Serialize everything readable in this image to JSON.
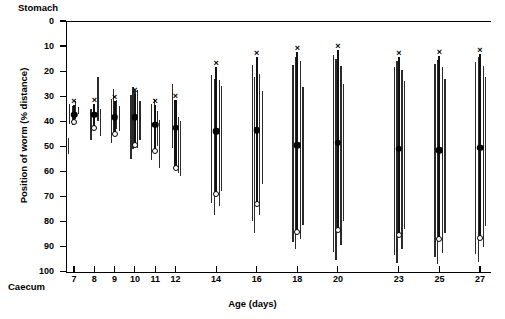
{
  "figure": {
    "stomach_label": "Stomach",
    "caecum_label": "Caecum",
    "x_axis_title": "Age (days)",
    "y_axis_title": "Position of worm (% distance)"
  },
  "chart_data": {
    "type": "scatter",
    "title": "",
    "xlabel": "Age (days)",
    "ylabel": "Position of worm (% distance)",
    "xlim": [
      6.2,
      28.4
    ],
    "ylim": [
      0,
      100
    ],
    "y_inverted": true,
    "grid": false,
    "legend": [],
    "y_ticks": [
      0,
      10,
      20,
      30,
      40,
      50,
      60,
      70,
      80,
      90,
      100
    ],
    "y_tick_labels": [
      "0",
      "10",
      "20",
      "30",
      "40",
      "50",
      "60",
      "70",
      "80",
      "90",
      "100"
    ],
    "x_ticks": [
      7,
      8,
      9,
      10,
      11,
      12,
      14,
      16,
      18,
      20,
      23,
      25,
      27
    ],
    "x_tick_labels": [
      "7",
      "8",
      "9",
      "10",
      "11",
      "12",
      "14",
      "16",
      "18",
      "20",
      "23",
      "25",
      "27"
    ],
    "axis_endpoint_annotations": {
      "top": "Stomach",
      "bottom": "Caecum"
    },
    "marker_meanings": {
      "cross": "upper extreme of worm distribution",
      "filled_circle": "mean position of worms",
      "open_circle": "lower extreme of worm distribution"
    },
    "series": [
      {
        "name": "Day 7",
        "x": 7,
        "summary": {
          "upper": 33.5,
          "mean": 37.5,
          "lower": 40.5
        },
        "ranges": [
          {
            "offset": -5,
            "top": 33.0,
            "bottom": 41.0
          },
          {
            "offset": -2,
            "top": 34.0,
            "bottom": 41.5
          },
          {
            "offset": 1,
            "top": 32.0,
            "bottom": 39.0
          },
          {
            "offset": 4,
            "top": 34.5,
            "bottom": 37.0
          },
          {
            "offset": -6,
            "top": 46.5,
            "bottom": 53.0
          }
        ]
      },
      {
        "name": "Day 8",
        "x": 8,
        "summary": {
          "upper": 33.0,
          "mean": 37.5,
          "lower": 42.5
        },
        "ranges": [
          {
            "offset": -4,
            "top": 35.0,
            "bottom": 47.5
          },
          {
            "offset": -1.5,
            "top": 33.5,
            "bottom": 44.0
          },
          {
            "offset": 3,
            "top": 22.5,
            "bottom": 40.0
          },
          {
            "offset": 5.5,
            "top": 35.0,
            "bottom": 46.0
          }
        ]
      },
      {
        "name": "Day 9",
        "x": 9,
        "summary": {
          "upper": 32.0,
          "mean": 38.5,
          "lower": 45.0
        },
        "ranges": [
          {
            "offset": -4,
            "top": 31.0,
            "bottom": 48.5
          },
          {
            "offset": -1.5,
            "top": 27.0,
            "bottom": 46.0
          },
          {
            "offset": 1.5,
            "top": 31.5,
            "bottom": 43.0
          },
          {
            "offset": 4,
            "top": 34.0,
            "bottom": 44.0
          }
        ]
      },
      {
        "name": "Day 10",
        "x": 10,
        "summary": {
          "upper": 29.0,
          "mean": 38.5,
          "lower": 49.5
        },
        "ranges": [
          {
            "offset": -4.5,
            "top": 29.5,
            "bottom": 55.0
          },
          {
            "offset": -2.5,
            "top": 26.5,
            "bottom": 51.0
          },
          {
            "offset": -0.5,
            "top": 28.0,
            "bottom": 49.0
          },
          {
            "offset": 2,
            "top": 27.5,
            "bottom": 50.5
          },
          {
            "offset": 4.5,
            "top": 32.0,
            "bottom": 47.5
          }
        ]
      },
      {
        "name": "Day 11",
        "x": 11,
        "summary": {
          "upper": 33.5,
          "mean": 41.5,
          "lower": 52.0
        },
        "ranges": [
          {
            "offset": -4,
            "top": 33.0,
            "bottom": 55.5
          },
          {
            "offset": -1.5,
            "top": 31.0,
            "bottom": 52.5
          },
          {
            "offset": 1.5,
            "top": 36.0,
            "bottom": 50.0
          },
          {
            "offset": 4,
            "top": 39.5,
            "bottom": 58.5
          }
        ]
      },
      {
        "name": "Day 12",
        "x": 12,
        "summary": {
          "upper": 31.5,
          "mean": 42.5,
          "lower": 58.5
        },
        "ranges": [
          {
            "offset": -4,
            "top": 25.0,
            "bottom": 50.5
          },
          {
            "offset": -1.5,
            "top": 34.0,
            "bottom": 56.0
          },
          {
            "offset": 2,
            "top": 38.5,
            "bottom": 60.5
          },
          {
            "offset": 4.5,
            "top": 40.0,
            "bottom": 62.0
          }
        ]
      },
      {
        "name": "Day 14",
        "x": 14,
        "summary": {
          "upper": 18.5,
          "mean": 44.0,
          "lower": 69.0
        },
        "ranges": [
          {
            "offset": -5,
            "top": 21.5,
            "bottom": 72.5
          },
          {
            "offset": -2.5,
            "top": 23.0,
            "bottom": 77.5
          },
          {
            "offset": 2.5,
            "top": 23.5,
            "bottom": 74.0
          },
          {
            "offset": 5,
            "top": 26.0,
            "bottom": 68.0
          }
        ]
      },
      {
        "name": "Day 16",
        "x": 16,
        "summary": {
          "upper": 14.5,
          "mean": 43.5,
          "lower": 73.0
        },
        "ranges": [
          {
            "offset": -5,
            "top": 17.5,
            "bottom": 80.0
          },
          {
            "offset": -2.5,
            "top": 22.5,
            "bottom": 84.5
          },
          {
            "offset": 2.5,
            "top": 21.0,
            "bottom": 77.5
          },
          {
            "offset": 5,
            "top": 28.0,
            "bottom": 65.0
          }
        ]
      },
      {
        "name": "Day 18",
        "x": 18,
        "summary": {
          "upper": 12.5,
          "mean": 49.5,
          "lower": 84.0
        },
        "ranges": [
          {
            "offset": -5,
            "top": 17.5,
            "bottom": 88.0
          },
          {
            "offset": -2.5,
            "top": 14.5,
            "bottom": 91.0
          },
          {
            "offset": 2.5,
            "top": 16.0,
            "bottom": 87.0
          },
          {
            "offset": 5,
            "top": 26.5,
            "bottom": 81.5
          }
        ]
      },
      {
        "name": "Day 20",
        "x": 20,
        "summary": {
          "upper": 11.5,
          "mean": 48.5,
          "lower": 83.5
        },
        "ranges": [
          {
            "offset": -5,
            "top": 13.5,
            "bottom": 92.0
          },
          {
            "offset": -2.5,
            "top": 15.0,
            "bottom": 95.5
          },
          {
            "offset": 2.5,
            "top": 18.0,
            "bottom": 89.5
          },
          {
            "offset": 5,
            "top": 25.0,
            "bottom": 80.0
          }
        ]
      },
      {
        "name": "Day 23",
        "x": 23,
        "summary": {
          "upper": 14.5,
          "mean": 51.0,
          "lower": 85.5
        },
        "ranges": [
          {
            "offset": -5,
            "top": 18.5,
            "bottom": 93.5
          },
          {
            "offset": -2.5,
            "top": 16.0,
            "bottom": 96.5
          },
          {
            "offset": 2.5,
            "top": 19.5,
            "bottom": 91.0
          },
          {
            "offset": 5,
            "top": 24.0,
            "bottom": 83.0
          }
        ]
      },
      {
        "name": "Day 25",
        "x": 25,
        "summary": {
          "upper": 14.0,
          "mean": 51.5,
          "lower": 87.0
        },
        "ranges": [
          {
            "offset": -5,
            "top": 17.0,
            "bottom": 94.0
          },
          {
            "offset": -2.5,
            "top": 15.5,
            "bottom": 97.0
          },
          {
            "offset": 2.5,
            "top": 18.5,
            "bottom": 92.5
          },
          {
            "offset": 5,
            "top": 23.0,
            "bottom": 84.5
          }
        ]
      },
      {
        "name": "Day 27",
        "x": 27,
        "summary": {
          "upper": 13.0,
          "mean": 50.5,
          "lower": 86.5
        },
        "ranges": [
          {
            "offset": -5,
            "top": 16.5,
            "bottom": 93.0
          },
          {
            "offset": -2.5,
            "top": 14.5,
            "bottom": 96.0
          },
          {
            "offset": 2.5,
            "top": 18.0,
            "bottom": 90.0
          },
          {
            "offset": 5,
            "top": 22.5,
            "bottom": 82.0
          }
        ]
      }
    ]
  }
}
